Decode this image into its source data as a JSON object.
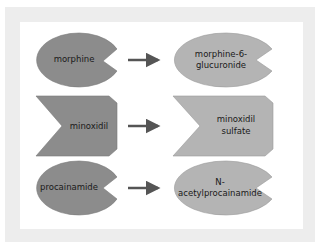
{
  "colors": {
    "frame": "#ededed",
    "panel": "#ffffff",
    "substrate_fill": "#8c8c8c",
    "product_fill": "#b4b4b4",
    "arrow": "#555555",
    "text": "#1a1a1a"
  },
  "rows": [
    {
      "substrate": {
        "label": "morphine",
        "shape": "pacman-ellipse"
      },
      "product": {
        "label": "morphine-6-glucuronide",
        "line1": "morphine-6-",
        "line2": "glucuronide",
        "shape": "pacman-ellipse"
      }
    },
    {
      "substrate": {
        "label": "minoxidil",
        "shape": "notched-pentagon"
      },
      "product": {
        "label": "minoxidil sulfate",
        "line1": "minoxidil",
        "line2": "sulfate",
        "shape": "notched-pentagon"
      }
    },
    {
      "substrate": {
        "label": "procainamide",
        "shape": "pacman-ellipse"
      },
      "product": {
        "label": "N-acetylprocainamide",
        "line1": "N-",
        "line2": "acetylprocainamide",
        "shape": "pacman-ellipse"
      }
    }
  ]
}
